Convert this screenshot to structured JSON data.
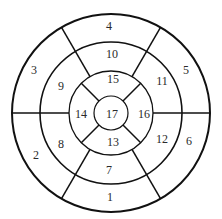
{
  "diagram": {
    "center": {
      "x": 111,
      "y": 113
    },
    "stroke_color": "#111111",
    "rings": {
      "outer_radius": 99,
      "basal_inner_radius": 71,
      "mid_inner_radius": 42,
      "apex_radius": 17
    },
    "segments": [
      {
        "id": "1",
        "label": "1",
        "x": 110,
        "y": 198
      },
      {
        "id": "2",
        "label": "2",
        "x": 36,
        "y": 156
      },
      {
        "id": "3",
        "label": "3",
        "x": 34,
        "y": 71
      },
      {
        "id": "4",
        "label": "4",
        "x": 109,
        "y": 27
      },
      {
        "id": "5",
        "label": "5",
        "x": 186,
        "y": 71
      },
      {
        "id": "6",
        "label": "6",
        "x": 189,
        "y": 142
      },
      {
        "id": "7",
        "label": "7",
        "x": 109,
        "y": 171
      },
      {
        "id": "8",
        "label": "8",
        "x": 61,
        "y": 145
      },
      {
        "id": "9",
        "label": "9",
        "x": 61,
        "y": 87
      },
      {
        "id": "10",
        "label": "10",
        "x": 112,
        "y": 55
      },
      {
        "id": "11",
        "label": "11",
        "x": 162,
        "y": 82
      },
      {
        "id": "12",
        "label": "12",
        "x": 162,
        "y": 140
      },
      {
        "id": "13",
        "label": "13",
        "x": 113,
        "y": 143
      },
      {
        "id": "14",
        "label": "14",
        "x": 81,
        "y": 115
      },
      {
        "id": "15",
        "label": "15",
        "x": 113,
        "y": 80
      },
      {
        "id": "16",
        "label": "16",
        "x": 144,
        "y": 115
      },
      {
        "id": "17",
        "label": "17",
        "x": 112,
        "y": 115
      }
    ]
  }
}
